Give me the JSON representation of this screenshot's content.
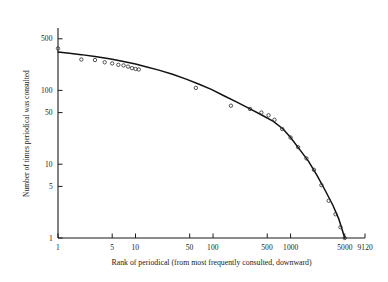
{
  "chart_data": {
    "type": "line",
    "title": "",
    "subtitle": "",
    "xlabel": "Rank of periodical (from most frequently consulted, downward)",
    "ylabel": "Number of times periodical was consulted",
    "xscale": "log",
    "yscale": "log",
    "xlim": [
      1,
      9120
    ],
    "ylim": [
      1,
      700
    ],
    "grid": false,
    "legend": null,
    "xticks": [
      1,
      5,
      10,
      50,
      100,
      500,
      1000,
      5000,
      9120
    ],
    "xticklabels": [
      "1",
      "5",
      "10",
      "50",
      "100",
      "500",
      "1000",
      "5000",
      "9120"
    ],
    "yticks": [
      1,
      5,
      10,
      50,
      100,
      500
    ],
    "yticklabels": [
      "1",
      "5",
      "10",
      "50",
      "100",
      "500"
    ],
    "series": [
      {
        "name": "fitted curve",
        "style": "solid-line",
        "x": [
          1,
          1.4,
          2,
          3,
          4,
          5,
          7,
          10,
          14,
          20,
          30,
          45,
          65,
          95,
          140,
          200,
          300,
          430,
          600,
          800,
          1000,
          1300,
          1700,
          2200,
          2800,
          3500,
          4200,
          5000
        ],
        "y": [
          330,
          318,
          305,
          288,
          275,
          264,
          246,
          228,
          208,
          188,
          165,
          142,
          122,
          103,
          84,
          70,
          56,
          46,
          38,
          30,
          23,
          16,
          11,
          7.0,
          4.4,
          2.8,
          1.8,
          1.0
        ]
      },
      {
        "name": "observed points",
        "style": "open-circle-markers",
        "x": [
          1,
          2,
          3,
          4,
          5,
          6,
          7,
          8,
          9,
          10,
          11,
          60,
          170,
          300,
          420,
          520,
          620,
          780,
          1000,
          1250,
          1600,
          2000,
          2500,
          3100,
          3800,
          4400,
          5000
        ],
        "y": [
          370,
          262,
          258,
          240,
          232,
          222,
          218,
          210,
          200,
          195,
          192,
          108,
          62,
          56,
          50,
          46,
          40,
          30,
          23,
          17,
          12,
          8.4,
          5.2,
          3.2,
          2.1,
          1.4,
          1.0
        ]
      }
    ]
  },
  "axes": {
    "axis_color": "#1a1a1a",
    "curve_color": "#111111",
    "marker_color": "#2b2b2b",
    "background": "#ffffff"
  }
}
